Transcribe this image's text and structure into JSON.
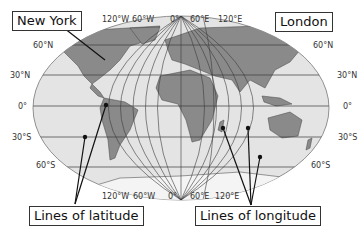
{
  "diagram": {
    "callouts": {
      "new_york": "New York",
      "london": "London",
      "latitude": "Lines of latitude",
      "longitude": "Lines of longitude"
    },
    "top_longitude_labels": [
      "120°W",
      "60°W",
      "0°",
      "60°E",
      "120°E"
    ],
    "bottom_longitude_labels": [
      "120°W",
      "60°W",
      "0°",
      "60°E",
      "120°E"
    ],
    "left_latitude_labels": [
      "60°N",
      "30°N",
      "0°",
      "30°S",
      "60°S"
    ],
    "right_latitude_labels": [
      "60°N",
      "30°N",
      "0°",
      "30°S",
      "60°S"
    ],
    "colors": {
      "ocean": "#e4e4e4",
      "land": "#8a8a8a",
      "grid": "#3a3a3a",
      "ice": "#f4f4f4"
    }
  }
}
